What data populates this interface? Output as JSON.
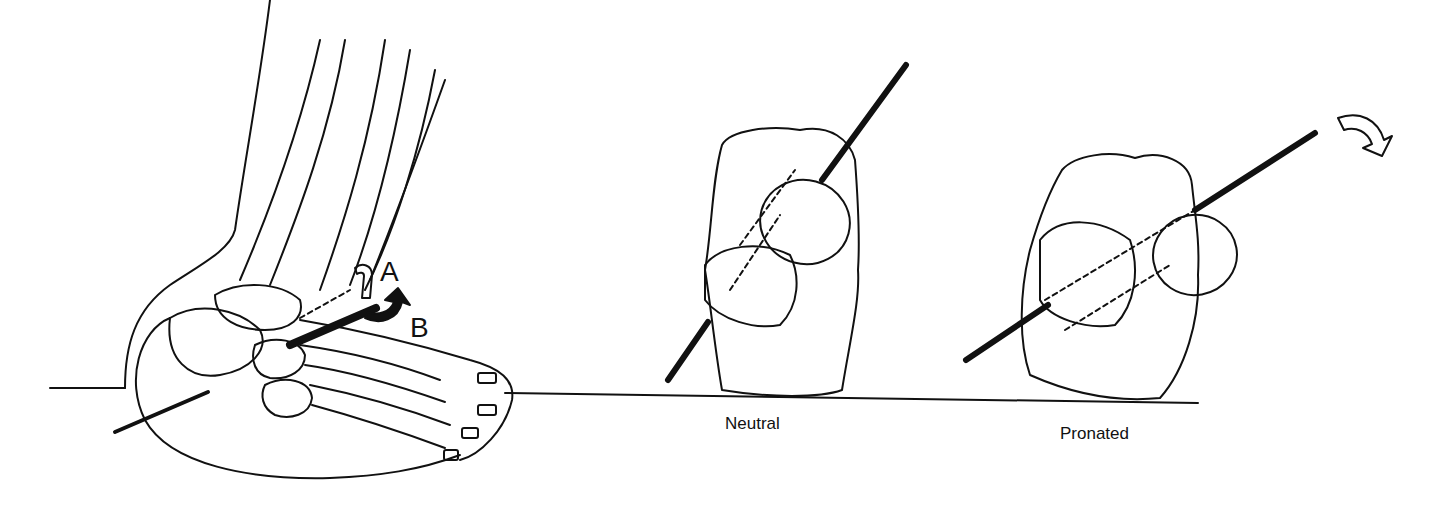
{
  "figure": {
    "panels": [
      {
        "id": "foot-lateral-view",
        "labels": {
          "a": "A",
          "b": "B"
        }
      },
      {
        "id": "subtalar-neutral",
        "caption": "Neutral"
      },
      {
        "id": "subtalar-pronated",
        "caption": "Pronated"
      }
    ],
    "colors": {
      "ink": "#111111",
      "background": "#ffffff"
    }
  }
}
